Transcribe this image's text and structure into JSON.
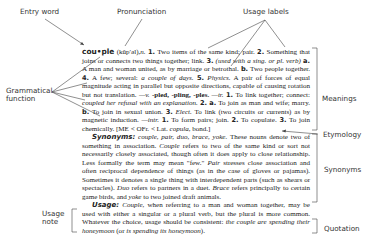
{
  "callouts": {
    "entry_word": "Entry word",
    "pronunciation": "Pronunciation",
    "usage_labels": "Usage labels",
    "grammatical_function_1": "Grammatical",
    "grammatical_function_2": "function",
    "meanings": "Meanings",
    "etymology": "Etymology",
    "synonyms": "Synonyms",
    "usage_note_1": "Usage",
    "usage_note_2": "note",
    "quotation": "Quotation"
  },
  "entry": {
    "headword": "cou•ple",
    "pronunciation": "(kŭp′əl),",
    "pos_noun": "n.",
    "m1_num": "1.",
    "m1": "Two items of the same kind; pair.",
    "m2_num": "2.",
    "m2": "Something that joins or connects two things together; link.",
    "m3_num": "3.",
    "m3_label": "(used with a sing. or pl. verb)",
    "m3a_num": "a.",
    "m3a": "A man and woman united, as by marriage or betrothal.",
    "m3b_num": "b.",
    "m3b": "Two people together.",
    "m4_num": "4.",
    "m4": "A few; several:",
    "m4_example": "a couple of days.",
    "m5_num": "5.",
    "m5_label": "Physics.",
    "m5": "A pair of forces of equal magnitude acting in parallel but opposite directions, capable of causing rotation but not translation.",
    "verb_forms_pos": "—v.",
    "verb_forms": "-pled, -pling, -ples.",
    "tr_label": "—tr.",
    "tr1_num": "1.",
    "tr1": "To link together; connect:",
    "tr1_example": "coupled her refusal with an explanation.",
    "tr2_num": "2.",
    "tr2a_num": "a.",
    "tr2a": "To join as man and wife; marry.",
    "tr2b_num": "b.",
    "tr2b": "To join in sexual union.",
    "tr3_num": "3.",
    "tr3_label": "Elect.",
    "tr3": "To link (two circuits or currents) as by magnetic induction.",
    "intr_label": "—intr.",
    "intr1_num": "1.",
    "intr1": "To form pairs; join.",
    "intr2_num": "2.",
    "intr2": "To copulate.",
    "intr3_num": "3.",
    "intr3": "To join chemically.",
    "etymology_pre": "[ME < OFr. < Lat.",
    "etymology_word": "copula,",
    "etymology_post": "bond.]"
  },
  "synonyms": {
    "heading": "Synonyms:",
    "list": "couple, pair, duo, brace, yoke.",
    "text_1": "These nouns denote two of something in association.",
    "couple_word": "Couple",
    "text_2": "refers to two of the same kind or sort not necessarily closely associated, though often it does apply to close relationship. Less formally the term may mean \"few.\"",
    "pair_word": "Pair",
    "text_3": "stresses close association and often reciprocal dependence of things (as in the case of gloves or pajamas). Sometimes it denotes a single thing with interdependent parts (such as shears or spectacles).",
    "duo_word": "Duo",
    "text_4": "refers to partners in a duet.",
    "brace_word": "Brace",
    "text_5": "refers principally to certain game birds, and",
    "yoke_word": "yoke",
    "text_6": "to two joined draft animals."
  },
  "usage": {
    "heading": "Usage:",
    "couple_word": "Couple,",
    "text": "when referring to a man and woman together, may be used with either a singular or a plural verb, but the plural is more common. Whatever the choice, usage should be consistent:",
    "quote_1": "the couple are spending their honeymoon",
    "quote_paren_open": "(or",
    "quote_2": "is spending its honeymoon",
    "quote_paren_close": ")."
  },
  "colors": {
    "text": "#222222",
    "label": "#333333",
    "line": "#444444"
  }
}
